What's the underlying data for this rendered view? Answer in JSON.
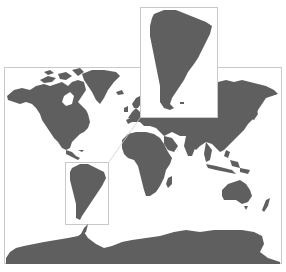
{
  "map": {
    "type": "world-map",
    "projection": "cylindrical (Mercator-like)",
    "colors": {
      "land": "#5f5f5f",
      "ocean": "#ffffff",
      "frame": "#c9c9c9",
      "inset_border": "#c9c9c9"
    },
    "frame": {
      "x": 4,
      "y": 67,
      "width": 278,
      "height": 197
    },
    "highlight_region": {
      "name": "South America",
      "box": {
        "x": 65,
        "y": 162,
        "width": 44,
        "height": 63
      }
    },
    "inset": {
      "name": "South America",
      "description": "Enlarged inset of South America",
      "box": {
        "x": 140,
        "y": 7,
        "width": 78,
        "height": 111
      }
    },
    "continents": [
      "North America",
      "Greenland",
      "South America",
      "Europe",
      "Africa",
      "Asia",
      "Australia",
      "Antarctica"
    ]
  }
}
